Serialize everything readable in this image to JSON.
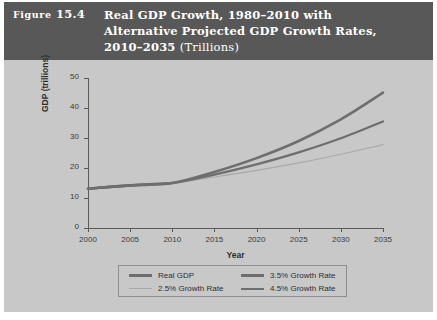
{
  "figure": {
    "number_prefix": "Figure",
    "number": "15.4",
    "title_line_1": "Real GDP Growth, 1980–2010 with",
    "title_line_2": "Alternative Projected GDP Growth Rates,",
    "title_line_3_bold": "2010–2035 ",
    "title_line_3_light": "(Trillions)"
  },
  "chart_data": {
    "type": "line",
    "title": "Real GDP Growth, 1980–2010 with Alternative Projected GDP Growth Rates, 2010–2035 (Trillions)",
    "xlabel": "Year",
    "ylabel": "GDP (trillions)",
    "xlim": [
      2000,
      2035
    ],
    "ylim": [
      0,
      50
    ],
    "xticks": [
      2000,
      2005,
      2010,
      2015,
      2020,
      2025,
      2030,
      2035
    ],
    "yticks": [
      0,
      10,
      20,
      30,
      40,
      50
    ],
    "grid": false,
    "legend_position": "bottom",
    "x": [
      2000,
      2005,
      2010,
      2015,
      2020,
      2025,
      2030,
      2035
    ],
    "series": [
      {
        "name": "Real GDP",
        "color": "#6e6e6e",
        "width": 2.6,
        "values": [
          13.1,
          14.2,
          15.0,
          15.0,
          15.0,
          15.0,
          15.0,
          15.0
        ],
        "segment_end_index": 2
      },
      {
        "name": "2.5% Growth Rate",
        "color": "#a8a8a8",
        "width": 1.1,
        "values": [
          13.1,
          14.2,
          15.0,
          17.0,
          19.2,
          21.7,
          24.6,
          27.8
        ]
      },
      {
        "name": "3.5% Growth Rate",
        "color": "#6e6e6e",
        "width": 2.2,
        "values": [
          13.1,
          14.2,
          15.0,
          17.8,
          21.2,
          25.2,
          29.9,
          35.5
        ]
      },
      {
        "name": "4.5% Growth Rate",
        "color": "#6e6e6e",
        "width": 2.6,
        "values": [
          13.1,
          14.2,
          15.0,
          18.7,
          23.3,
          29.0,
          36.2,
          45.1
        ]
      }
    ]
  },
  "legend": [
    {
      "label": "Real GDP",
      "color": "#6e6e6e",
      "width": 3
    },
    {
      "label": "2.5% Growth Rate",
      "color": "#a8a8a8",
      "width": 1
    },
    {
      "label": "3.5% Growth Rate",
      "color": "#6e6e6e",
      "width": 3
    },
    {
      "label": "4.5% Growth Rate",
      "color": "#6e6e6e",
      "width": 2
    }
  ]
}
